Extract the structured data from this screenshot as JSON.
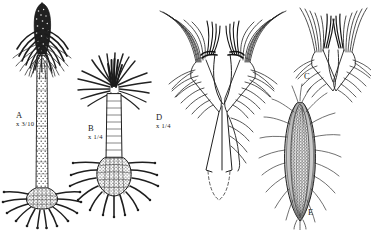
{
  "plate": {
    "title": "Scientific illustration plate of five crinoid specimens",
    "background_color": "#ffffff",
    "ink_color": "#1a1a1a",
    "width": 371,
    "height": 230
  },
  "figures": [
    {
      "id": "A",
      "letter": "A",
      "scale": "x 3/10",
      "description": "Tall stalked crinoid with dark conical crown, long dotted column and radiating root cirri at base"
    },
    {
      "id": "B",
      "letter": "B",
      "scale": "x 1/4",
      "description": "Shorter crinoid with palm-like spreading arms, short segmented column and dense radiating root cirri"
    },
    {
      "id": "C",
      "letter": "C",
      "scale": "",
      "description": "Detail of crown with feathery pinnulate arms"
    },
    {
      "id": "D",
      "letter": "D",
      "scale": "x 1/4",
      "description": "V-shaped forked calyx with two arm clusters converging into a tapering stalk drawn with dashed outline"
    },
    {
      "id": "E",
      "letter": "E",
      "scale": "",
      "description": "Elongate lanceolate body with fine longitudinal striations and radiating filaments"
    }
  ]
}
